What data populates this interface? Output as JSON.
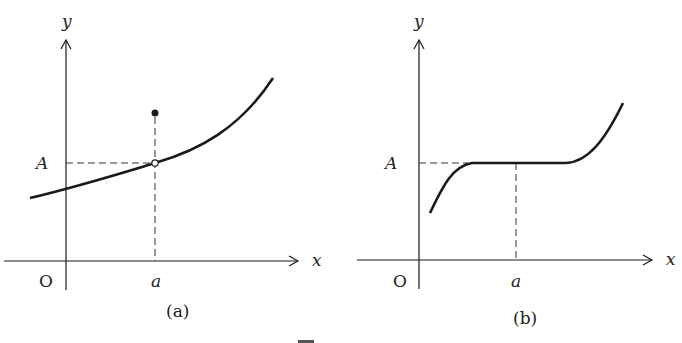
{
  "figures": [
    {
      "id": "a",
      "caption": "(a)",
      "x_label": "x",
      "y_label": "y",
      "origin_label": "O",
      "x_tick_label": "a",
      "y_tick_label": "A",
      "description": "Increasing continuous curve with a removable point: open circle on the curve at (a, A) and a filled dot above it at x = a"
    },
    {
      "id": "b",
      "caption": "(b)",
      "x_label": "x",
      "y_label": "y",
      "origin_label": "O",
      "x_tick_label": "a",
      "y_tick_label": "A",
      "description": "Curve rising to a flat segment at height A spanning around x = a, then rising again"
    }
  ],
  "colors": {
    "stroke": "#1a1a1a",
    "background": "#ffffff"
  }
}
